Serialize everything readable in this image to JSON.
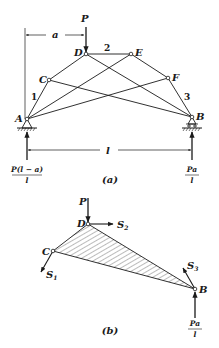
{
  "figure_a": {
    "caption": "(a)",
    "joints": {
      "A": "A",
      "B": "B",
      "C": "C",
      "D": "D",
      "E": "E",
      "F": "F"
    },
    "member_labels": {
      "m1": "1",
      "m2": "2",
      "m3": "3"
    },
    "load_label": "P",
    "dim_a": "a",
    "dim_l": "l",
    "reaction_A": {
      "num": "P(l − a)",
      "den": "l"
    },
    "reaction_B": {
      "num": "Pa",
      "den": "l"
    }
  },
  "figure_b": {
    "caption": "(b)",
    "joints": {
      "C": "C",
      "D": "D",
      "B": "B"
    },
    "load_label": "P",
    "forces": {
      "S1": "S",
      "S1_sub": "1",
      "S2": "S",
      "S2_sub": "2",
      "S3": "S",
      "S3_sub": "3"
    },
    "reaction_B": {
      "num": "Pa",
      "den": "l"
    }
  },
  "colors": {
    "ink": "#1a1a1a",
    "background": "#ffffff"
  }
}
